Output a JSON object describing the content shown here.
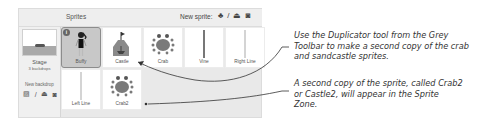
{
  "stage_panel": {
    "label": "Stage",
    "backdrops_count": "3 backdrops",
    "new_backdrop_label": "New backdrop",
    "backdrop_tools": [
      {
        "icon": "picture-icon",
        "glyph": "▨"
      },
      {
        "icon": "paint-icon",
        "glyph": "/"
      },
      {
        "icon": "upload-icon",
        "glyph": "⏏"
      },
      {
        "icon": "camera-icon",
        "glyph": "◙"
      }
    ]
  },
  "sprites_panel": {
    "title": "Sprites",
    "new_sprite_label": "New sprite:",
    "new_sprite_tools": [
      {
        "icon": "sprite-library-icon",
        "glyph": "♣"
      },
      {
        "icon": "paint-icon",
        "glyph": "/"
      },
      {
        "icon": "upload-icon",
        "glyph": "⏏"
      },
      {
        "icon": "camera-icon",
        "glyph": "◙"
      }
    ],
    "sprites": [
      {
        "name": "Buffy",
        "selected": true,
        "info_badge": "i"
      },
      {
        "name": "Castle",
        "selected": false
      },
      {
        "name": "Crab",
        "selected": false
      },
      {
        "name": "Vine",
        "selected": false
      },
      {
        "name": "Right Line",
        "selected": false
      },
      {
        "name": "Left Line",
        "selected": false
      },
      {
        "name": "Crab2",
        "selected": false
      }
    ]
  },
  "callouts": [
    {
      "text": "Use the Duplicator tool from the Grey Toolbar to make a second copy of the crab and sandcastle sprites.",
      "points_to": "Castle"
    },
    {
      "text": "A second copy of the sprite, called Crab2 or Castle2, will appear in the Sprite Zone.",
      "points_to": "Crab2"
    }
  ],
  "colors": {
    "panel_bg": "#e9e9e9",
    "tile_bg": "#ffffff",
    "selected_tile_bg": "#c8c8c8",
    "crab": "#7a7a7a",
    "text": "#333333"
  }
}
